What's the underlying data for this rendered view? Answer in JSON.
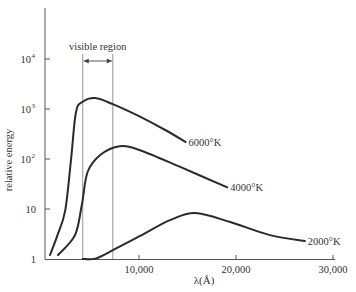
{
  "chart_data": {
    "type": "line",
    "title": "",
    "xlabel": "λ(Å)",
    "ylabel": "relative energy",
    "xscale": "linear",
    "yscale": "log",
    "xlim": [
      0,
      30000
    ],
    "ylim": [
      1,
      100000
    ],
    "x_ticks": [
      10000,
      20000,
      30000
    ],
    "x_tick_labels": [
      "10,000",
      "20,000",
      "30,000"
    ],
    "y_ticks": [
      1,
      10,
      100,
      1000,
      10000
    ],
    "y_tick_labels": [
      {
        "base": "1",
        "exp": ""
      },
      {
        "base": "10",
        "exp": ""
      },
      {
        "base": "10",
        "exp": "2"
      },
      {
        "base": "10",
        "exp": "3"
      },
      {
        "base": "10",
        "exp": "4"
      }
    ],
    "grid": false,
    "legend": "inline labels at curve ends",
    "annotations": [
      {
        "text": "visible region",
        "x_range": [
          4200,
          7300
        ],
        "type": "bracket-arrow with vertical lines"
      }
    ],
    "series": [
      {
        "name": "6000°K",
        "label_text": "6000°K",
        "x": [
          820,
          1600,
          2400,
          3000,
          3500,
          4200,
          5500,
          7300,
          10100,
          12700,
          14800
        ],
        "y": [
          1.2,
          3,
          9.5,
          100,
          870,
          1400,
          1650,
          1250,
          700,
          380,
          220
        ]
      },
      {
        "name": "4000°K",
        "label_text": "4000°K",
        "x": [
          1650,
          3400,
          4100,
          4700,
          6000,
          8000,
          10100,
          14200,
          19100
        ],
        "y": [
          1.2,
          3,
          12,
          55,
          120,
          180,
          150,
          70,
          27
        ]
      },
      {
        "name": "2000°K",
        "label_text": "2000°K",
        "x": [
          4200,
          5500,
          7300,
          10100,
          13200,
          15800,
          19400,
          23500,
          27100
        ],
        "y": [
          1.0,
          1.02,
          1.5,
          2.9,
          6,
          8.3,
          5.5,
          3,
          2.3
        ]
      }
    ],
    "line_color": "#2a2a2a",
    "axis_color": "#555555",
    "visible_line_color": "#888888"
  }
}
